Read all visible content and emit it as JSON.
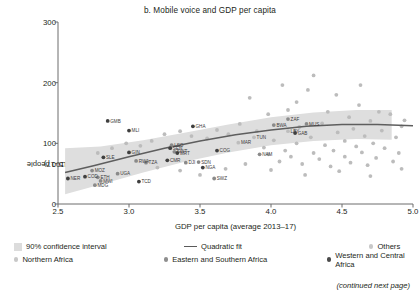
{
  "figure": {
    "title": "b. Mobile voice and GDP per capita",
    "footer_note": "(continued next page)"
  },
  "axes": {
    "ylabel_line1": "Subscriptions per 100 people",
    "ylabel_line2": "(average 2015–17)",
    "xlabel": "GDP per capita (average 2013–17)",
    "yticks": [
      "0",
      "100",
      "200",
      "300"
    ],
    "xticks": [
      "2.5",
      "3.0",
      "3.5",
      "4.0",
      "4.5",
      "5.0"
    ]
  },
  "legend": {
    "items": [
      {
        "label": "90% confidence interval",
        "marker": "band",
        "color": "#dcdcdc"
      },
      {
        "label": "Quadratic fit",
        "marker": "line",
        "color": "#5a5a5a"
      },
      {
        "label": "Others",
        "marker": "dot-light",
        "color": "#c8c8c8"
      },
      {
        "label": "Northern Africa",
        "marker": "dot-light",
        "color": "#c8c8c8"
      },
      {
        "label": "Eastern and Southern Africa",
        "marker": "dot-mid",
        "color": "#8e8e8e"
      },
      {
        "label": "Western and Central Africa",
        "marker": "dot-dark",
        "color": "#4a4a4a"
      }
    ]
  },
  "chart_data": {
    "type": "scatter",
    "title": "b. Mobile voice and GDP per capita",
    "xlabel": "GDP per capita (average 2013–17)",
    "ylabel": "Subscriptions per 100 people (average 2015–17)",
    "xlim": [
      2.5,
      5.0
    ],
    "ylim": [
      0,
      300
    ],
    "grid": false,
    "legend_position": "below",
    "labeled_points": [
      {
        "code": "NER",
        "x": 2.57,
        "y": 42,
        "group": "western-central"
      },
      {
        "code": "MOZ",
        "x": 2.74,
        "y": 55,
        "group": "eastern-southern"
      },
      {
        "code": "COD",
        "x": 2.69,
        "y": 45,
        "group": "western-central"
      },
      {
        "code": "ETH",
        "x": 2.78,
        "y": 44,
        "group": "eastern-southern"
      },
      {
        "code": "MWI",
        "x": 2.8,
        "y": 38,
        "group": "eastern-southern"
      },
      {
        "code": "MDG",
        "x": 2.76,
        "y": 31,
        "group": "eastern-southern"
      },
      {
        "code": "UGA",
        "x": 2.92,
        "y": 50,
        "group": "eastern-southern"
      },
      {
        "code": "TCD",
        "x": 3.07,
        "y": 37,
        "group": "western-central"
      },
      {
        "code": "SLE",
        "x": 2.82,
        "y": 77,
        "group": "western-central"
      },
      {
        "code": "GIN",
        "x": 3.0,
        "y": 85,
        "group": "western-central"
      },
      {
        "code": "RWA",
        "x": 3.05,
        "y": 71,
        "group": "eastern-southern"
      },
      {
        "code": "TZA",
        "x": 3.12,
        "y": 68,
        "group": "eastern-southern"
      },
      {
        "code": "GMB",
        "x": 2.85,
        "y": 137,
        "group": "western-central"
      },
      {
        "code": "MLI",
        "x": 3.0,
        "y": 121,
        "group": "western-central"
      },
      {
        "code": "GHA",
        "x": 3.45,
        "y": 128,
        "group": "western-central"
      },
      {
        "code": "LSO",
        "x": 3.3,
        "y": 97,
        "group": "eastern-southern"
      },
      {
        "code": "SEN",
        "x": 3.29,
        "y": 92,
        "group": "western-central"
      },
      {
        "code": "SWT",
        "x": 3.32,
        "y": 86,
        "group": "eastern-southern"
      },
      {
        "code": "MRT",
        "x": 3.34,
        "y": 84,
        "group": "western-central"
      },
      {
        "code": "CMR",
        "x": 3.27,
        "y": 72,
        "group": "western-central"
      },
      {
        "code": "DJI",
        "x": 3.4,
        "y": 68,
        "group": "eastern-southern"
      },
      {
        "code": "SDN",
        "x": 3.49,
        "y": 69,
        "group": "eastern-southern"
      },
      {
        "code": "NGA",
        "x": 3.52,
        "y": 60,
        "group": "western-central"
      },
      {
        "code": "SWZ",
        "x": 3.6,
        "y": 42,
        "group": "eastern-southern"
      },
      {
        "code": "COG",
        "x": 3.62,
        "y": 88,
        "group": "western-central"
      },
      {
        "code": "MAR",
        "x": 3.77,
        "y": 101,
        "group": "northern"
      },
      {
        "code": "TUN",
        "x": 3.88,
        "y": 110,
        "group": "northern"
      },
      {
        "code": "NAM",
        "x": 3.92,
        "y": 82,
        "group": "eastern-southern"
      },
      {
        "code": "BWA",
        "x": 4.02,
        "y": 130,
        "group": "eastern-southern"
      },
      {
        "code": "ZAF",
        "x": 4.12,
        "y": 140,
        "group": "eastern-southern"
      },
      {
        "code": "LBY",
        "x": 4.12,
        "y": 120,
        "group": "northern"
      },
      {
        "code": "GAB",
        "x": 4.17,
        "y": 117,
        "group": "western-central"
      },
      {
        "code": "MUS",
        "x": 4.25,
        "y": 132,
        "group": "eastern-southern"
      }
    ],
    "fit_curve": {
      "name": "Quadratic fit",
      "points": [
        {
          "x": 2.55,
          "y": 52
        },
        {
          "x": 2.75,
          "y": 63
        },
        {
          "x": 3.0,
          "y": 78
        },
        {
          "x": 3.25,
          "y": 92
        },
        {
          "x": 3.5,
          "y": 104
        },
        {
          "x": 3.75,
          "y": 114
        },
        {
          "x": 4.0,
          "y": 122
        },
        {
          "x": 4.25,
          "y": 128
        },
        {
          "x": 4.5,
          "y": 131
        },
        {
          "x": 4.75,
          "y": 131
        },
        {
          "x": 5.0,
          "y": 129
        }
      ]
    },
    "confidence_band": {
      "level": "90%",
      "x_range": [
        2.55,
        4.85
      ],
      "upper": [
        {
          "x": 2.55,
          "y": 92
        },
        {
          "x": 2.8,
          "y": 95
        },
        {
          "x": 3.1,
          "y": 105
        },
        {
          "x": 3.4,
          "y": 118
        },
        {
          "x": 3.7,
          "y": 131
        },
        {
          "x": 4.0,
          "y": 143
        },
        {
          "x": 4.3,
          "y": 151
        },
        {
          "x": 4.6,
          "y": 155
        },
        {
          "x": 4.85,
          "y": 155
        }
      ],
      "lower": [
        {
          "x": 2.55,
          "y": 16
        },
        {
          "x": 2.8,
          "y": 32
        },
        {
          "x": 3.1,
          "y": 52
        },
        {
          "x": 3.4,
          "y": 70
        },
        {
          "x": 3.7,
          "y": 85
        },
        {
          "x": 4.0,
          "y": 97
        },
        {
          "x": 4.3,
          "y": 104
        },
        {
          "x": 4.6,
          "y": 107
        },
        {
          "x": 4.85,
          "y": 106
        }
      ]
    },
    "other_points": [
      {
        "x": 3.85,
        "y": 175
      },
      {
        "x": 4.08,
        "y": 196
      },
      {
        "x": 4.3,
        "y": 212
      },
      {
        "x": 4.18,
        "y": 168
      },
      {
        "x": 4.46,
        "y": 180
      },
      {
        "x": 4.62,
        "y": 163
      },
      {
        "x": 4.4,
        "y": 152
      },
      {
        "x": 4.55,
        "y": 143
      },
      {
        "x": 4.7,
        "y": 137
      },
      {
        "x": 4.84,
        "y": 148
      },
      {
        "x": 4.92,
        "y": 128
      },
      {
        "x": 4.58,
        "y": 124
      },
      {
        "x": 4.36,
        "y": 133
      },
      {
        "x": 4.2,
        "y": 127
      },
      {
        "x": 4.47,
        "y": 118
      },
      {
        "x": 4.66,
        "y": 112
      },
      {
        "x": 4.78,
        "y": 121
      },
      {
        "x": 4.28,
        "y": 110
      },
      {
        "x": 4.52,
        "y": 104
      },
      {
        "x": 4.72,
        "y": 100
      },
      {
        "x": 4.88,
        "y": 110
      },
      {
        "x": 4.6,
        "y": 95
      },
      {
        "x": 4.38,
        "y": 97
      },
      {
        "x": 4.18,
        "y": 100
      },
      {
        "x": 4.02,
        "y": 105
      },
      {
        "x": 4.44,
        "y": 88
      },
      {
        "x": 4.64,
        "y": 85
      },
      {
        "x": 4.8,
        "y": 92
      },
      {
        "x": 4.3,
        "y": 84
      },
      {
        "x": 4.1,
        "y": 88
      },
      {
        "x": 3.95,
        "y": 93
      },
      {
        "x": 4.52,
        "y": 78
      },
      {
        "x": 4.74,
        "y": 76
      },
      {
        "x": 4.9,
        "y": 84
      },
      {
        "x": 4.34,
        "y": 74
      },
      {
        "x": 4.14,
        "y": 78
      },
      {
        "x": 3.98,
        "y": 82
      },
      {
        "x": 4.56,
        "y": 68
      },
      {
        "x": 4.68,
        "y": 64
      },
      {
        "x": 4.86,
        "y": 70
      },
      {
        "x": 4.42,
        "y": 62
      },
      {
        "x": 4.22,
        "y": 66
      },
      {
        "x": 4.06,
        "y": 70
      },
      {
        "x": 3.9,
        "y": 120
      },
      {
        "x": 3.78,
        "y": 132
      },
      {
        "x": 3.7,
        "y": 115
      },
      {
        "x": 3.62,
        "y": 122
      },
      {
        "x": 3.55,
        "y": 108
      },
      {
        "x": 3.44,
        "y": 112
      },
      {
        "x": 3.36,
        "y": 120
      },
      {
        "x": 3.25,
        "y": 115
      },
      {
        "x": 3.16,
        "y": 104
      },
      {
        "x": 3.08,
        "y": 96
      },
      {
        "x": 2.98,
        "y": 100
      },
      {
        "x": 2.88,
        "y": 92
      },
      {
        "x": 2.78,
        "y": 84
      },
      {
        "x": 3.2,
        "y": 60
      },
      {
        "x": 3.36,
        "y": 55
      },
      {
        "x": 3.5,
        "y": 48
      },
      {
        "x": 3.68,
        "y": 58
      },
      {
        "x": 3.82,
        "y": 66
      },
      {
        "x": 4.0,
        "y": 56
      },
      {
        "x": 4.24,
        "y": 48
      },
      {
        "x": 4.48,
        "y": 54
      },
      {
        "x": 4.7,
        "y": 46
      },
      {
        "x": 4.92,
        "y": 58
      },
      {
        "x": 4.63,
        "y": 196
      },
      {
        "x": 4.26,
        "y": 188
      },
      {
        "x": 4.76,
        "y": 152
      },
      {
        "x": 4.94,
        "y": 138
      },
      {
        "x": 3.98,
        "y": 148
      },
      {
        "x": 4.12,
        "y": 155
      }
    ]
  }
}
